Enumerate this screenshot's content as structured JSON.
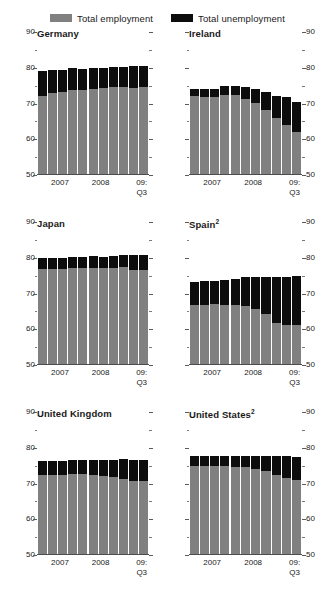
{
  "legend": {
    "items": [
      {
        "label": "Total employment",
        "color": "#808080",
        "name": "legend-total-employment"
      },
      {
        "label": "Total unemployment",
        "color": "#0d0d0d",
        "name": "legend-total-unemployment"
      }
    ]
  },
  "axis": {
    "ylim": [
      50,
      90
    ],
    "major_ticks": [
      50,
      60,
      70,
      80,
      90
    ],
    "minor_ticks": [
      55,
      65,
      75,
      85
    ],
    "tick_labels": [
      "50",
      "60",
      "70",
      "80",
      "90"
    ],
    "xtick_labels": [
      "2007",
      "2008",
      "09:\nQ3"
    ]
  },
  "chart_data": {
    "type": "bar",
    "title": "",
    "subtitle": "",
    "xlabel": "",
    "ylabel": "",
    "ylim": [
      50,
      90
    ],
    "grid": false,
    "legend_position": "top-center",
    "stacked": true,
    "series_names": [
      "Total employment",
      "Total unemployment"
    ],
    "series_colors": [
      "#808080",
      "#0d0d0d"
    ],
    "x": [
      "2007Q1",
      "2007Q2",
      "2007Q3",
      "2007Q4",
      "2008Q1",
      "2008Q2",
      "2008Q3",
      "2008Q4",
      "2009Q1",
      "2009Q2",
      "2009Q3"
    ],
    "panels": [
      {
        "name": "Germany",
        "title": "Germany",
        "footnote": "",
        "employment": [
          72.2,
          73.0,
          73.3,
          73.7,
          73.9,
          74.2,
          74.4,
          74.6,
          74.5,
          74.4,
          74.5
        ],
        "unemployment": [
          7.0,
          6.4,
          6.1,
          6.1,
          5.8,
          5.6,
          5.5,
          5.6,
          5.8,
          6.0,
          6.0
        ],
        "total": [
          79.2,
          79.4,
          79.4,
          79.8,
          79.7,
          79.8,
          79.9,
          80.2,
          80.3,
          80.4,
          80.5
        ]
      },
      {
        "name": "Ireland",
        "title": "Ireland",
        "footnote": "",
        "employment": [
          72.0,
          71.9,
          71.8,
          72.4,
          72.3,
          71.3,
          70.2,
          68.2,
          66.0,
          64.0,
          62.0
        ],
        "unemployment": [
          2.1,
          2.2,
          2.3,
          2.5,
          2.6,
          3.2,
          3.8,
          5.1,
          6.2,
          7.8,
          8.5
        ],
        "total": [
          74.1,
          74.1,
          74.1,
          74.9,
          74.9,
          74.5,
          74.0,
          73.3,
          72.2,
          71.8,
          70.5
        ]
      },
      {
        "name": "Japan",
        "title": "Japan",
        "footnote": "",
        "employment": [
          76.9,
          76.8,
          76.8,
          77.1,
          77.2,
          77.2,
          77.1,
          77.2,
          77.3,
          76.6,
          76.5
        ],
        "unemployment": [
          2.9,
          3.0,
          3.0,
          3.1,
          3.1,
          3.2,
          3.2,
          3.3,
          3.6,
          4.1,
          4.4
        ],
        "total": [
          79.8,
          79.8,
          79.8,
          80.2,
          80.3,
          80.4,
          80.3,
          80.5,
          80.9,
          80.7,
          80.9
        ]
      },
      {
        "name": "Spain",
        "title": "Spain",
        "footnote": "2",
        "employment": [
          66.8,
          66.9,
          67.0,
          66.9,
          66.9,
          66.6,
          65.8,
          64.4,
          61.7,
          61.3,
          61.2
        ],
        "unemployment": [
          6.4,
          6.5,
          6.6,
          6.9,
          7.2,
          7.9,
          8.9,
          10.2,
          12.8,
          13.4,
          13.8
        ],
        "total": [
          73.2,
          73.4,
          73.6,
          73.8,
          74.1,
          74.5,
          74.7,
          74.6,
          74.5,
          74.7,
          75.0
        ]
      },
      {
        "name": "United Kingdom",
        "title": "United Kingdom",
        "footnote": "",
        "employment": [
          72.3,
          72.4,
          72.5,
          72.6,
          72.6,
          72.5,
          72.2,
          71.8,
          71.2,
          70.8,
          70.6
        ],
        "unemployment": [
          3.9,
          3.9,
          3.8,
          3.9,
          3.9,
          4.1,
          4.4,
          4.9,
          5.6,
          5.9,
          6.0
        ],
        "total": [
          76.2,
          76.3,
          76.3,
          76.5,
          76.5,
          76.6,
          76.6,
          76.7,
          76.8,
          76.7,
          76.6
        ]
      },
      {
        "name": "United States",
        "title": "United States",
        "footnote": "2",
        "employment": [
          75.0,
          75.0,
          74.9,
          74.8,
          74.7,
          74.5,
          74.1,
          73.4,
          72.3,
          71.5,
          71.0
        ],
        "unemployment": [
          2.8,
          2.8,
          2.9,
          3.0,
          3.1,
          3.3,
          3.7,
          4.2,
          5.3,
          6.1,
          6.5
        ],
        "total": [
          77.8,
          77.8,
          77.8,
          77.8,
          77.8,
          77.8,
          77.8,
          77.6,
          77.6,
          77.6,
          77.5
        ]
      }
    ]
  }
}
